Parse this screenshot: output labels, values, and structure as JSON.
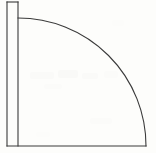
{
  "figure": {
    "kind": "geometric-line-drawing",
    "background_color": "#fdfdfb",
    "line_color": "#3a3a3a",
    "line_width": 1.1,
    "canvas": {
      "width": 156,
      "height": 153
    },
    "elements": {
      "outer_vertical_line": {
        "name": "outer-vertical-line",
        "x1": 7.0,
        "y1": 2.0,
        "x2": 7.0,
        "y2": 146.0
      },
      "inner_vertical_line": {
        "name": "inner-vertical-line",
        "x1": 18.0,
        "y1": 2.0,
        "x2": 18.0,
        "y2": 146.0
      },
      "top_connector_line": {
        "name": "top-connector-line",
        "x1": 7.0,
        "y1": 2.0,
        "x2": 18.0,
        "y2": 2.0
      },
      "bottom_base_line": {
        "name": "bottom-base-line",
        "x1": 7.0,
        "y1": 146.0,
        "x2": 146.0,
        "y2": 146.0
      },
      "quarter_arc": {
        "name": "quarter-circle-arc",
        "center_x": 18.0,
        "center_y": 146.0,
        "radius": 128.0,
        "start_x": 18.0,
        "start_y": 18.0,
        "end_x": 146.0,
        "end_y": 146.0,
        "sweep_degrees": 90
      }
    },
    "scan_artifacts": [
      {
        "x": 30,
        "y": 72,
        "w": 24,
        "h": 7,
        "color": "#fafaf8"
      },
      {
        "x": 58,
        "y": 70,
        "w": 20,
        "h": 8,
        "color": "#f9f9f7"
      },
      {
        "x": 82,
        "y": 73,
        "w": 16,
        "h": 6,
        "color": "#fafaf8"
      },
      {
        "x": 104,
        "y": 71,
        "w": 14,
        "h": 7,
        "color": "#fbfbf9"
      },
      {
        "x": 44,
        "y": 84,
        "w": 18,
        "h": 5,
        "color": "#fbfbf9"
      },
      {
        "x": 90,
        "y": 118,
        "w": 22,
        "h": 6,
        "color": "#fbfbf9"
      },
      {
        "x": 36,
        "y": 132,
        "w": 14,
        "h": 5,
        "color": "#fcfcfa"
      },
      {
        "x": 112,
        "y": 20,
        "w": 12,
        "h": 6,
        "color": "#fcfcfa"
      }
    ]
  }
}
